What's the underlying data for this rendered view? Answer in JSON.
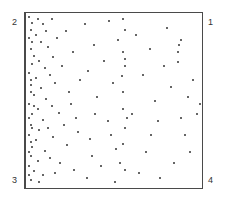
{
  "chart_data": {
    "type": "scatter",
    "title": "",
    "xlabel": "",
    "ylabel": "",
    "grid": false,
    "legend": null,
    "xlim": [
      0,
      1
    ],
    "ylim": [
      0,
      1
    ],
    "corner_labels": {
      "top_left": "2",
      "top_right": "1",
      "bottom_left": "3",
      "bottom_right": "4"
    },
    "note": "Points given as normalized [x, y] within frame, y measured from top; density decreases left to right",
    "points": [
      [
        0.01,
        0.02
      ],
      [
        0.03,
        0.05
      ],
      [
        0.02,
        0.09
      ],
      [
        0.06,
        0.03
      ],
      [
        0.09,
        0.06
      ],
      [
        0.05,
        0.12
      ],
      [
        0.11,
        0.1
      ],
      [
        0.14,
        0.03
      ],
      [
        0.08,
        0.16
      ],
      [
        0.02,
        0.2
      ],
      [
        0.04,
        0.24
      ],
      [
        0.12,
        0.19
      ],
      [
        0.17,
        0.14
      ],
      [
        0.03,
        0.29
      ],
      [
        0.07,
        0.27
      ],
      [
        0.15,
        0.25
      ],
      [
        0.1,
        0.31
      ],
      [
        0.01,
        0.34
      ],
      [
        0.05,
        0.37
      ],
      [
        0.13,
        0.35
      ],
      [
        0.2,
        0.3
      ],
      [
        0.02,
        0.41
      ],
      [
        0.08,
        0.43
      ],
      [
        0.16,
        0.4
      ],
      [
        0.04,
        0.47
      ],
      [
        0.11,
        0.49
      ],
      [
        0.01,
        0.52
      ],
      [
        0.06,
        0.55
      ],
      [
        0.14,
        0.53
      ],
      [
        0.03,
        0.58
      ],
      [
        0.09,
        0.61
      ],
      [
        0.18,
        0.57
      ],
      [
        0.02,
        0.64
      ],
      [
        0.07,
        0.67
      ],
      [
        0.12,
        0.66
      ],
      [
        0.01,
        0.7
      ],
      [
        0.05,
        0.73
      ],
      [
        0.15,
        0.71
      ],
      [
        0.03,
        0.77
      ],
      [
        0.1,
        0.79
      ],
      [
        0.02,
        0.82
      ],
      [
        0.06,
        0.85
      ],
      [
        0.13,
        0.83
      ],
      [
        0.01,
        0.88
      ],
      [
        0.04,
        0.91
      ],
      [
        0.09,
        0.93
      ],
      [
        0.02,
        0.96
      ],
      [
        0.07,
        0.97
      ],
      [
        0.16,
        0.92
      ],
      [
        0.19,
        0.86
      ],
      [
        0.01,
        0.14
      ],
      [
        0.02,
        0.45
      ],
      [
        0.01,
        0.6
      ],
      [
        0.02,
        0.74
      ],
      [
        0.01,
        0.93
      ],
      [
        0.03,
        0.66
      ],
      [
        0.04,
        0.53
      ],
      [
        0.02,
        0.38
      ],
      [
        0.03,
        0.16
      ],
      [
        0.01,
        0.8
      ],
      [
        0.22,
        0.1
      ],
      [
        0.26,
        0.22
      ],
      [
        0.24,
        0.45
      ],
      [
        0.28,
        0.6
      ],
      [
        0.23,
        0.76
      ],
      [
        0.27,
        0.9
      ],
      [
        0.3,
        0.38
      ],
      [
        0.25,
        0.52
      ],
      [
        0.29,
        0.68
      ],
      [
        0.21,
        0.64
      ],
      [
        0.33,
        0.06
      ],
      [
        0.38,
        0.18
      ],
      [
        0.35,
        0.33
      ],
      [
        0.4,
        0.48
      ],
      [
        0.36,
        0.72
      ],
      [
        0.42,
        0.88
      ],
      [
        0.34,
        0.95
      ],
      [
        0.39,
        0.58
      ],
      [
        0.44,
        0.27
      ],
      [
        0.37,
        0.82
      ],
      [
        0.47,
        0.04
      ],
      [
        0.52,
        0.15
      ],
      [
        0.49,
        0.4
      ],
      [
        0.55,
        0.55
      ],
      [
        0.48,
        0.7
      ],
      [
        0.53,
        0.86
      ],
      [
        0.5,
        0.97
      ],
      [
        0.56,
        0.3
      ],
      [
        0.46,
        0.62
      ],
      [
        0.51,
        0.78
      ],
      [
        0.55,
        0.03
      ],
      [
        0.56,
        0.09
      ],
      [
        0.55,
        0.22
      ],
      [
        0.56,
        0.26
      ],
      [
        0.55,
        0.45
      ],
      [
        0.56,
        0.66
      ],
      [
        0.55,
        0.75
      ],
      [
        0.56,
        0.9
      ],
      [
        0.57,
        0.6
      ],
      [
        0.54,
        0.36
      ],
      [
        0.62,
        0.12
      ],
      [
        0.66,
        0.35
      ],
      [
        0.6,
        0.58
      ],
      [
        0.68,
        0.8
      ],
      [
        0.64,
        0.92
      ],
      [
        0.7,
        0.2
      ],
      [
        0.73,
        0.5
      ],
      [
        0.71,
        0.7
      ],
      [
        0.76,
        0.95
      ],
      [
        0.78,
        0.3
      ],
      [
        0.75,
        0.62
      ],
      [
        0.8,
        0.08
      ],
      [
        0.82,
        0.42
      ],
      [
        0.84,
        0.86
      ],
      [
        0.86,
        0.28
      ],
      [
        0.88,
        0.15
      ],
      [
        0.87,
        0.18
      ],
      [
        0.86,
        0.22
      ],
      [
        0.88,
        0.6
      ],
      [
        0.9,
        0.7
      ],
      [
        0.92,
        0.48
      ],
      [
        0.95,
        0.38
      ],
      [
        0.97,
        0.58
      ],
      [
        0.93,
        0.8
      ],
      [
        0.99,
        0.52
      ]
    ]
  }
}
